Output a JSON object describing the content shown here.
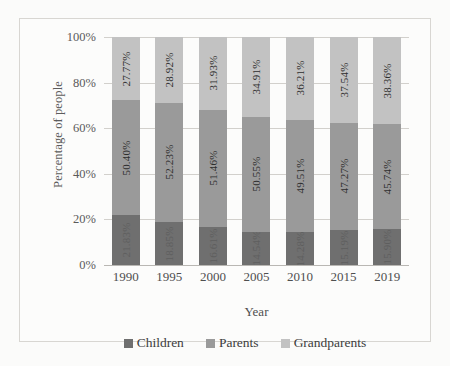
{
  "chart_data": {
    "type": "bar",
    "subtype": "100% stacked bar",
    "title": "",
    "xlabel": "Year",
    "ylabel": "Percentage of people",
    "categories": [
      "1990",
      "1995",
      "2000",
      "2005",
      "2010",
      "2015",
      "2019"
    ],
    "ylim": [
      0,
      100
    ],
    "ytick_labels": [
      "0%",
      "20%",
      "40%",
      "60%",
      "80%",
      "100%"
    ],
    "ytick_values": [
      0,
      20,
      40,
      60,
      80,
      100
    ],
    "grid": true,
    "legend_position": "bottom",
    "series": [
      {
        "name": "Children",
        "color": "#6f6f6f",
        "values": [
          21.83,
          18.85,
          16.61,
          14.54,
          14.28,
          15.19,
          15.9
        ],
        "labels": [
          "21.83%",
          "18.85%",
          "16.61%",
          "14.54%",
          "14.28%",
          "15.19%",
          "15.90%"
        ],
        "labels_legible": false
      },
      {
        "name": "Parents",
        "color": "#9a9a9a",
        "values": [
          50.4,
          52.23,
          51.46,
          50.55,
          49.51,
          47.27,
          45.74
        ],
        "labels": [
          "50.40%",
          "52.23%",
          "51.46%",
          "50.55%",
          "49.51%",
          "47.27%",
          "45.74%"
        ],
        "labels_legible": true
      },
      {
        "name": "Grandparents",
        "color": "#c2c2c2",
        "values": [
          27.77,
          28.92,
          31.93,
          34.91,
          36.21,
          37.54,
          38.36
        ],
        "labels": [
          "27.77%",
          "28.92%",
          "31.93%",
          "34.91%",
          "36.21%",
          "37.54%",
          "38.36%"
        ],
        "labels_legible": true
      }
    ]
  }
}
